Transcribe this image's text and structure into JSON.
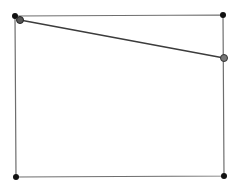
{
  "diagram": {
    "background": "#ffffff",
    "rect": {
      "points": [
        [
          15,
          16
        ],
        [
          223,
          15
        ],
        [
          224,
          176
        ],
        [
          16,
          177
        ]
      ],
      "stroke": "#6e6e6e",
      "stroke_width": 1.2
    },
    "segment": {
      "from": [
        20,
        20
      ],
      "to": [
        224,
        58
      ],
      "stroke": "#3c3c3c",
      "stroke_width": 1.6
    },
    "vertices": [
      {
        "name": "top-left",
        "x": 15,
        "y": 16,
        "r": 3,
        "fill": "#111111"
      },
      {
        "name": "top-right",
        "x": 223,
        "y": 15,
        "r": 3,
        "fill": "#111111"
      },
      {
        "name": "bottom-right",
        "x": 224,
        "y": 176,
        "r": 3,
        "fill": "#111111"
      },
      {
        "name": "bottom-left",
        "x": 16,
        "y": 177,
        "r": 3,
        "fill": "#111111"
      }
    ],
    "segment_endpoints": [
      {
        "name": "start",
        "x": 20,
        "y": 20,
        "r": 3.5,
        "fill": "#555555",
        "stroke": "#222222"
      },
      {
        "name": "end",
        "x": 224,
        "y": 58,
        "r": 3.5,
        "fill": "#777777",
        "stroke": "#333333"
      }
    ]
  }
}
